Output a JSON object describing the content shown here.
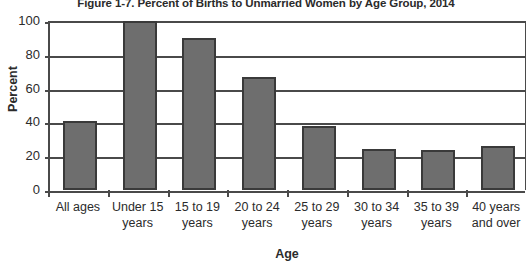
{
  "chart_data": {
    "type": "bar",
    "title": "Figure 1-7. Percent of Births to Unmarried Women by Age Group, 2014",
    "xlabel": "Age",
    "ylabel": "Percent",
    "ylim": [
      0,
      100
    ],
    "yticks": [
      0,
      20,
      40,
      60,
      80,
      100
    ],
    "grid": true,
    "legend": null,
    "categories": [
      "All ages",
      "Under 15 years",
      "15 to 19 years",
      "20 to 24 years",
      "25 to 29 years",
      "30 to 34 years",
      "35 to 39 years",
      "40 years and over"
    ],
    "category_lines": [
      [
        "All ages"
      ],
      [
        "Under 15",
        "years"
      ],
      [
        "15 to 19",
        "years"
      ],
      [
        "20 to 24",
        "years"
      ],
      [
        "25 to 29",
        "years"
      ],
      [
        "30 to 34",
        "years"
      ],
      [
        "35 to 39",
        "years"
      ],
      [
        "40 years",
        "and over"
      ]
    ],
    "values": [
      40.6,
      100.0,
      89.7,
      67.0,
      38.0,
      24.2,
      23.5,
      26.0
    ],
    "bar_color": "#6e6e6e",
    "bar_border_color": "#3a3a3a",
    "axis_color": "#4a4a4a"
  }
}
